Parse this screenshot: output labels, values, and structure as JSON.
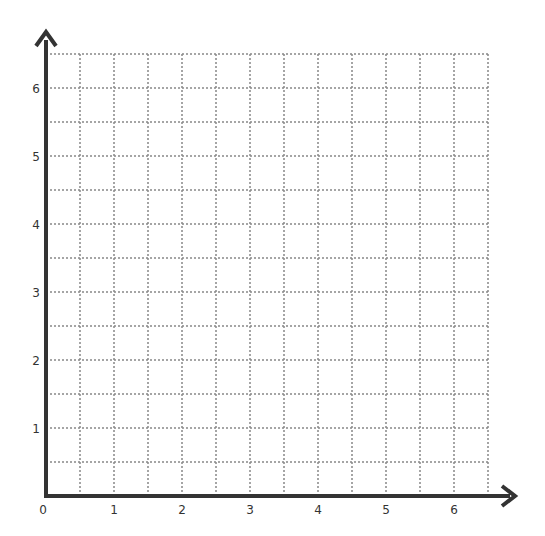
{
  "chart_data": {
    "type": "scatter",
    "title": "",
    "xlabel": "",
    "ylabel": "",
    "xlim": [
      0,
      6.5
    ],
    "ylim": [
      0,
      6.5
    ],
    "grid": true,
    "grid_style": "dotted",
    "grid_step": 0.5,
    "x_ticks": [
      "0",
      "1",
      "2",
      "3",
      "4",
      "5",
      "6"
    ],
    "y_ticks": [
      "1",
      "2",
      "3",
      "4",
      "5",
      "6"
    ],
    "series": [],
    "legend": null
  },
  "colors": {
    "axis": "#333333",
    "grid": "#888888",
    "background": "#ffffff"
  }
}
